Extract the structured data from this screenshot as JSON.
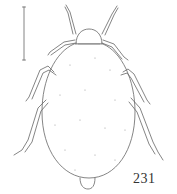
{
  "figure": {
    "number": "231",
    "scale_bar": {
      "present": true,
      "orientation": "vertical"
    },
    "colors": {
      "line": "#555555",
      "background": "#ffffff"
    }
  }
}
